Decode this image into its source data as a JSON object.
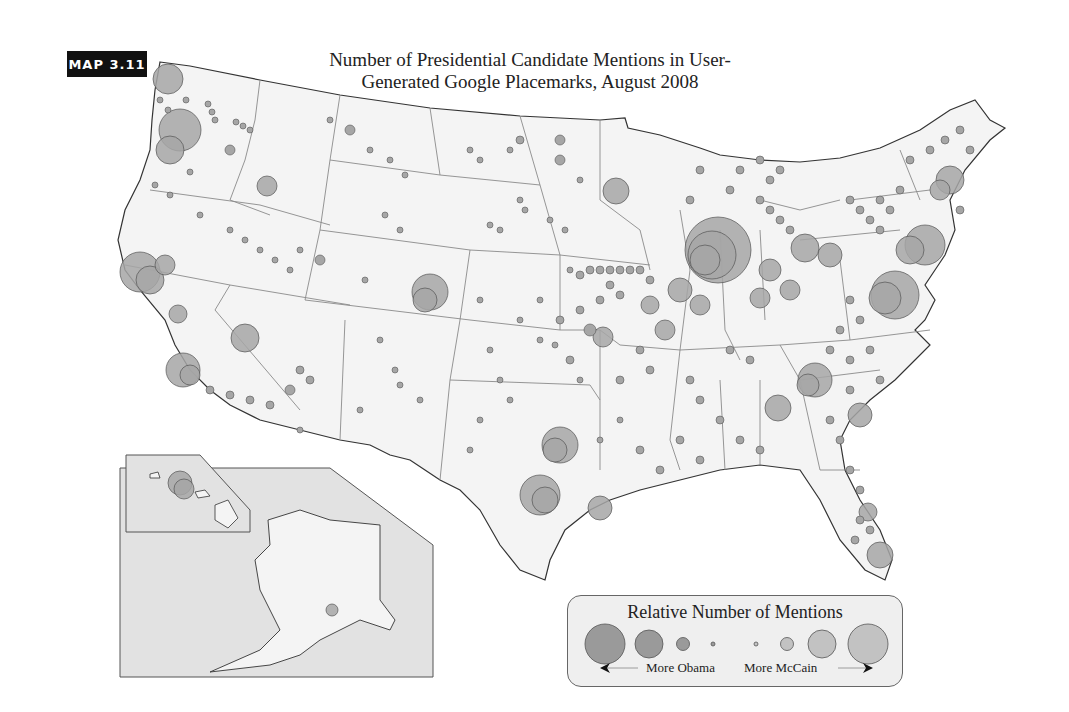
{
  "badge": {
    "label": "MAP 3.11"
  },
  "title": {
    "line1": "Number of Presidential Candidate Mentions in User-",
    "line2": "Generated Google Placemarks, August 2008"
  },
  "legend": {
    "title": "Relative Number of Mentions",
    "left_label": "More Obama",
    "right_label": "More McCain",
    "obama_color": "#9a9a9a",
    "mccain_color": "#c2c2c2",
    "circle_sizes_left_to_right": [
      "large",
      "medium",
      "small",
      "tiny",
      "tiny",
      "small",
      "medium",
      "large"
    ]
  },
  "colors": {
    "land": "#f4f4f4",
    "inset_bg": "#e2e2e2",
    "state_border": "#888888",
    "coast": "#333333",
    "circle_fill": "#a6a6a6",
    "circle_stroke": "#555555"
  },
  "insets": [
    "Hawaii",
    "Alaska"
  ]
}
